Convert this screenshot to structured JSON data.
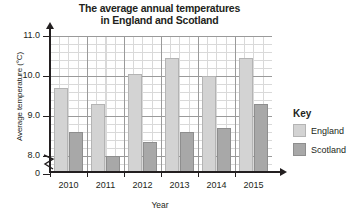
{
  "chart_data": {
    "type": "bar",
    "title": "The average annual temperatures in England and Scotland",
    "title_line1": "The average annual temperatures",
    "title_line2": "in England and Scotland",
    "xlabel": "Year",
    "ylabel": "Average temperature (°C)",
    "categories": [
      "2010",
      "2011",
      "2012",
      "2013",
      "2014",
      "2015"
    ],
    "series": [
      {
        "name": "England",
        "color": "#d3d3d3",
        "values": [
          9.7,
          9.3,
          10.05,
          10.45,
          10.0,
          10.45
        ]
      },
      {
        "name": "Scotland",
        "color": "#a8a8a8",
        "values": [
          8.6,
          8.0,
          8.35,
          8.6,
          8.7,
          9.3
        ]
      }
    ],
    "ylim": [
      7.6,
      11.0
    ],
    "y_ticks": [
      "0",
      "8.0",
      "9.0",
      "10.0",
      "11.0"
    ],
    "y_tick_values": [
      7.6,
      8.0,
      9.0,
      10.0,
      11.0
    ],
    "y_axis_break": true,
    "grid": true,
    "grid_major_step": 1.0,
    "grid_minor_step": 0.2,
    "legend_position": "right"
  },
  "legend": {
    "title": "Key",
    "entries": [
      {
        "label": "England"
      },
      {
        "label": "Scotland"
      }
    ]
  }
}
